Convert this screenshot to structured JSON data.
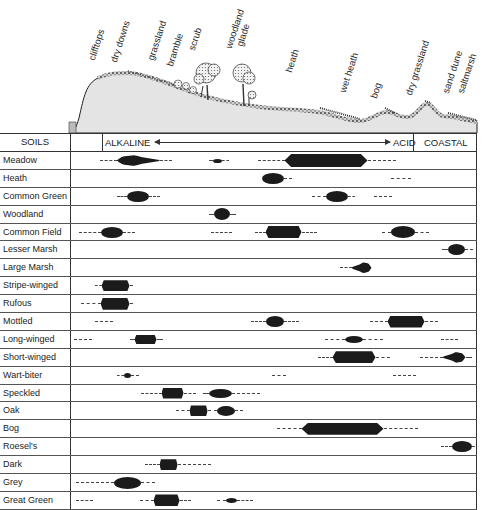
{
  "habitats": [
    {
      "label": "clifftops",
      "x": 96,
      "y": 60
    },
    {
      "label": "dry downs",
      "x": 118,
      "y": 62
    },
    {
      "label": "grassland",
      "x": 155,
      "y": 60
    },
    {
      "label": "bramble",
      "x": 174,
      "y": 66
    },
    {
      "label": "scrub",
      "x": 196,
      "y": 50
    },
    {
      "label": "woodland",
      "x": 233,
      "y": 48
    },
    {
      "label": "glade",
      "x": 244,
      "y": 46
    },
    {
      "label": "heath",
      "x": 293,
      "y": 72
    },
    {
      "label": "wet heath",
      "x": 347,
      "y": 92
    },
    {
      "label": "bog",
      "x": 378,
      "y": 98
    },
    {
      "label": "dry grassland",
      "x": 413,
      "y": 95
    },
    {
      "label": "sand dune",
      "x": 450,
      "y": 93
    },
    {
      "label": "saltmarsh",
      "x": 465,
      "y": 93
    }
  ],
  "header": {
    "soils_label": "SOILS",
    "alkaline_label": "ALKALINE",
    "acid_label": "ACID",
    "coastal_label": "COASTAL"
  },
  "chart_data": {
    "type": "table",
    "x_axis": {
      "left": "ALKALINE",
      "right": "ACID",
      "extra": "COASTAL"
    },
    "habitats_left_to_right": [
      "clifftops",
      "dry downs",
      "grassland",
      "bramble",
      "scrub",
      "woodland glade",
      "heath",
      "wet heath",
      "bog",
      "dry grassland",
      "sand dune",
      "saltmarsh"
    ],
    "legend": {
      "solid": "main occurrence (thickness = abundance)",
      "dashed": "occasional occurrence"
    },
    "rows": [
      {
        "species": "Meadow",
        "segments": [
          {
            "type": "dash",
            "x0": 100,
            "x1": 117
          },
          {
            "type": "blob",
            "x0": 117,
            "x1": 160,
            "h": 11,
            "shape": "tear"
          },
          {
            "type": "dash",
            "x0": 160,
            "x1": 172
          },
          {
            "type": "dash",
            "x0": 209,
            "x1": 213
          },
          {
            "type": "blob",
            "x0": 213,
            "x1": 222,
            "h": 4
          },
          {
            "type": "dash",
            "x0": 222,
            "x1": 229
          },
          {
            "type": "dash",
            "x0": 258,
            "x1": 285
          },
          {
            "type": "blob",
            "x0": 285,
            "x1": 368,
            "h": 13,
            "shape": "flat"
          },
          {
            "type": "dash",
            "x0": 368,
            "x1": 396
          }
        ]
      },
      {
        "species": "Heath",
        "segments": [
          {
            "type": "blob",
            "x0": 262,
            "x1": 284,
            "h": 11
          },
          {
            "type": "dash",
            "x0": 284,
            "x1": 292
          },
          {
            "type": "dash",
            "x0": 391,
            "x1": 411
          }
        ]
      },
      {
        "species": "Common Green",
        "segments": [
          {
            "type": "dash",
            "x0": 117,
            "x1": 127
          },
          {
            "type": "blob",
            "x0": 127,
            "x1": 149,
            "h": 11
          },
          {
            "type": "dash",
            "x0": 149,
            "x1": 160
          },
          {
            "type": "dash",
            "x0": 312,
            "x1": 326
          },
          {
            "type": "blob",
            "x0": 326,
            "x1": 348,
            "h": 11
          },
          {
            "type": "dash",
            "x0": 348,
            "x1": 355
          },
          {
            "type": "dash",
            "x0": 374,
            "x1": 392
          }
        ]
      },
      {
        "species": "Woodland",
        "segments": [
          {
            "type": "dash",
            "x0": 209,
            "x1": 214
          },
          {
            "type": "blob",
            "x0": 214,
            "x1": 230,
            "h": 12
          },
          {
            "type": "dash",
            "x0": 230,
            "x1": 236
          }
        ]
      },
      {
        "species": "Common Field",
        "segments": [
          {
            "type": "dash",
            "x0": 79,
            "x1": 101
          },
          {
            "type": "blob",
            "x0": 101,
            "x1": 123,
            "h": 11
          },
          {
            "type": "dash",
            "x0": 123,
            "x1": 135
          },
          {
            "type": "dash",
            "x0": 211,
            "x1": 232
          },
          {
            "type": "dash",
            "x0": 255,
            "x1": 266
          },
          {
            "type": "blob",
            "x0": 266,
            "x1": 302,
            "h": 12,
            "shape": "flat"
          },
          {
            "type": "dash",
            "x0": 302,
            "x1": 317
          },
          {
            "type": "dash",
            "x0": 382,
            "x1": 391
          },
          {
            "type": "blob",
            "x0": 391,
            "x1": 415,
            "h": 12
          },
          {
            "type": "dash",
            "x0": 415,
            "x1": 429
          }
        ]
      },
      {
        "species": "Lesser Marsh",
        "segments": [
          {
            "type": "dash",
            "x0": 442,
            "x1": 448
          },
          {
            "type": "blob",
            "x0": 448,
            "x1": 465,
            "h": 11
          },
          {
            "type": "dash",
            "x0": 465,
            "x1": 473
          }
        ]
      },
      {
        "species": "Large Marsh",
        "segments": [
          {
            "type": "dash",
            "x0": 340,
            "x1": 352
          },
          {
            "type": "blob",
            "x0": 352,
            "x1": 372,
            "h": 11,
            "shape": "tear-r"
          }
        ]
      },
      {
        "species": "Stripe-winged",
        "segments": [
          {
            "type": "dash",
            "x0": 95,
            "x1": 102
          },
          {
            "type": "blob",
            "x0": 102,
            "x1": 130,
            "h": 11,
            "shape": "flat"
          },
          {
            "type": "dash",
            "x0": 130,
            "x1": 133
          }
        ]
      },
      {
        "species": "Rufous",
        "segments": [
          {
            "type": "dash",
            "x0": 81,
            "x1": 101
          },
          {
            "type": "blob",
            "x0": 101,
            "x1": 130,
            "h": 12,
            "shape": "flat"
          },
          {
            "type": "dash",
            "x0": 130,
            "x1": 133
          }
        ]
      },
      {
        "species": "Mottled",
        "segments": [
          {
            "type": "dash",
            "x0": 95,
            "x1": 113
          },
          {
            "type": "dash",
            "x0": 251,
            "x1": 266
          },
          {
            "type": "blob",
            "x0": 266,
            "x1": 284,
            "h": 11
          },
          {
            "type": "dash",
            "x0": 284,
            "x1": 299
          },
          {
            "type": "dash",
            "x0": 370,
            "x1": 388
          },
          {
            "type": "blob",
            "x0": 388,
            "x1": 425,
            "h": 12,
            "shape": "flat"
          },
          {
            "type": "dash",
            "x0": 425,
            "x1": 438
          }
        ]
      },
      {
        "species": "Long-winged",
        "segments": [
          {
            "type": "dash",
            "x0": 74,
            "x1": 92
          },
          {
            "type": "dash",
            "x0": 130,
            "x1": 135
          },
          {
            "type": "blob",
            "x0": 135,
            "x1": 157,
            "h": 9,
            "shape": "flat"
          },
          {
            "type": "dash",
            "x0": 157,
            "x1": 163
          },
          {
            "type": "dash",
            "x0": 325,
            "x1": 345
          },
          {
            "type": "blob",
            "x0": 345,
            "x1": 363,
            "h": 7
          },
          {
            "type": "dash",
            "x0": 363,
            "x1": 383
          },
          {
            "type": "dash",
            "x0": 441,
            "x1": 458
          }
        ]
      },
      {
        "species": "Short-winged",
        "segments": [
          {
            "type": "dash",
            "x0": 318,
            "x1": 333
          },
          {
            "type": "blob",
            "x0": 333,
            "x1": 376,
            "h": 12,
            "shape": "flat"
          },
          {
            "type": "dash",
            "x0": 376,
            "x1": 390
          },
          {
            "type": "dash",
            "x0": 420,
            "x1": 443
          },
          {
            "type": "blob",
            "x0": 443,
            "x1": 466,
            "h": 11,
            "shape": "tear-r"
          },
          {
            "type": "dash",
            "x0": 466,
            "x1": 472
          }
        ]
      },
      {
        "species": "Wart-biter",
        "segments": [
          {
            "type": "dash",
            "x0": 117,
            "x1": 124
          },
          {
            "type": "blob",
            "x0": 124,
            "x1": 131,
            "h": 5
          },
          {
            "type": "dash",
            "x0": 131,
            "x1": 139
          },
          {
            "type": "dash",
            "x0": 272,
            "x1": 286
          },
          {
            "type": "dash",
            "x0": 393,
            "x1": 416
          }
        ]
      },
      {
        "species": "Speckled",
        "segments": [
          {
            "type": "dash",
            "x0": 141,
            "x1": 162
          },
          {
            "type": "blob",
            "x0": 162,
            "x1": 184,
            "h": 11,
            "shape": "flat"
          },
          {
            "type": "dash",
            "x0": 184,
            "x1": 196
          },
          {
            "type": "dash",
            "x0": 203,
            "x1": 209
          },
          {
            "type": "blob",
            "x0": 209,
            "x1": 232,
            "h": 9
          },
          {
            "type": "dash",
            "x0": 232,
            "x1": 260
          }
        ]
      },
      {
        "species": "Oak",
        "segments": [
          {
            "type": "dash",
            "x0": 176,
            "x1": 190
          },
          {
            "type": "blob",
            "x0": 190,
            "x1": 208,
            "h": 11,
            "shape": "flat"
          },
          {
            "type": "dash",
            "x0": 208,
            "x1": 217
          },
          {
            "type": "blob",
            "x0": 217,
            "x1": 235,
            "h": 10
          },
          {
            "type": "dash",
            "x0": 235,
            "x1": 243
          }
        ]
      },
      {
        "species": "Bog",
        "segments": [
          {
            "type": "dash",
            "x0": 277,
            "x1": 302
          },
          {
            "type": "blob",
            "x0": 302,
            "x1": 384,
            "h": 12,
            "shape": "flat"
          },
          {
            "type": "dash",
            "x0": 384,
            "x1": 418
          }
        ]
      },
      {
        "species": "Roesel's",
        "segments": [
          {
            "type": "dash",
            "x0": 441,
            "x1": 452
          },
          {
            "type": "blob",
            "x0": 452,
            "x1": 472,
            "h": 11
          },
          {
            "type": "dash",
            "x0": 472,
            "x1": 475
          }
        ]
      },
      {
        "species": "Dark",
        "segments": [
          {
            "type": "dash",
            "x0": 145,
            "x1": 160
          },
          {
            "type": "blob",
            "x0": 160,
            "x1": 178,
            "h": 11,
            "shape": "flat"
          },
          {
            "type": "dash",
            "x0": 178,
            "x1": 211
          }
        ]
      },
      {
        "species": "Grey",
        "segments": [
          {
            "type": "dash",
            "x0": 76,
            "x1": 114
          },
          {
            "type": "blob",
            "x0": 114,
            "x1": 141,
            "h": 12
          },
          {
            "type": "dash",
            "x0": 141,
            "x1": 155
          }
        ]
      },
      {
        "species": "Great Green",
        "segments": [
          {
            "type": "dash",
            "x0": 76,
            "x1": 93
          },
          {
            "type": "dash",
            "x0": 140,
            "x1": 154
          },
          {
            "type": "blob",
            "x0": 154,
            "x1": 180,
            "h": 12,
            "shape": "flat"
          },
          {
            "type": "dash",
            "x0": 180,
            "x1": 191
          },
          {
            "type": "dash",
            "x0": 217,
            "x1": 226
          },
          {
            "type": "blob",
            "x0": 226,
            "x1": 237,
            "h": 5
          },
          {
            "type": "dash",
            "x0": 237,
            "x1": 253
          }
        ]
      }
    ]
  }
}
